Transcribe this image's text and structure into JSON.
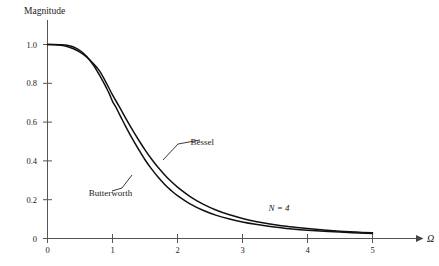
{
  "chart_data": {
    "type": "line",
    "title": "",
    "xlabel": "Ω",
    "ylabel": "Magnitude",
    "xlim": [
      0,
      5.3
    ],
    "ylim": [
      0,
      1.06
    ],
    "xticks": [
      "0",
      "1",
      "2",
      "3",
      "4",
      "5"
    ],
    "xtick_values": [
      0,
      1,
      2,
      3,
      4,
      5
    ],
    "yticks": [
      "0",
      "0.2",
      "0.4",
      "0.6",
      "0.8",
      "1.0"
    ],
    "ytick_values": [
      0,
      0.2,
      0.4,
      0.6,
      0.8,
      1.0
    ],
    "grid": false,
    "legend_position": "inline-annotations",
    "annotations": [
      {
        "text": "Bessel",
        "x": 2.2,
        "y": 0.5
      },
      {
        "text": "Butterworth",
        "x": 0.35,
        "y": 0.235
      },
      {
        "text": "N = 4",
        "x": 3.4,
        "y": 0.155
      }
    ],
    "series": [
      {
        "name": "Butterworth",
        "order": 4,
        "x": [
          0.0,
          0.1,
          0.2,
          0.3,
          0.4,
          0.5,
          0.6,
          0.7,
          0.8,
          0.85,
          0.9,
          0.95,
          1.0,
          1.05,
          1.1,
          1.15,
          1.2,
          1.3,
          1.4,
          1.5,
          1.6,
          1.7,
          1.8,
          1.9,
          2.0,
          2.2,
          2.4,
          2.6,
          2.8,
          3.0,
          3.2,
          3.4,
          3.6,
          3.8,
          4.0,
          4.5,
          5.0
        ],
        "y": [
          1.0,
          1.0,
          0.999,
          0.996,
          0.987,
          0.969,
          0.939,
          0.896,
          0.842,
          0.812,
          0.78,
          0.747,
          0.707,
          0.678,
          0.645,
          0.612,
          0.579,
          0.517,
          0.46,
          0.406,
          0.359,
          0.317,
          0.28,
          0.248,
          0.221,
          0.177,
          0.144,
          0.119,
          0.1,
          0.085,
          0.073,
          0.063,
          0.055,
          0.048,
          0.043,
          0.033,
          0.026
        ]
      },
      {
        "name": "Bessel",
        "order": 4,
        "x": [
          0.0,
          0.1,
          0.2,
          0.3,
          0.4,
          0.5,
          0.6,
          0.7,
          0.8,
          0.9,
          1.0,
          1.1,
          1.2,
          1.3,
          1.4,
          1.5,
          1.6,
          1.7,
          1.8,
          1.9,
          2.0,
          2.2,
          2.4,
          2.6,
          2.8,
          3.0,
          3.2,
          3.4,
          3.6,
          3.8,
          4.0,
          4.25,
          4.5,
          4.75,
          5.0
        ],
        "y": [
          1.0,
          0.999,
          0.996,
          0.99,
          0.978,
          0.961,
          0.936,
          0.903,
          0.864,
          0.805,
          0.74,
          0.682,
          0.622,
          0.564,
          0.509,
          0.457,
          0.41,
          0.367,
          0.329,
          0.295,
          0.265,
          0.215,
          0.176,
          0.146,
          0.122,
          0.103,
          0.088,
          0.076,
          0.066,
          0.058,
          0.051,
          0.044,
          0.038,
          0.033,
          0.029
        ]
      }
    ]
  },
  "labels": {
    "y_axis_title": "Magnitude",
    "x_axis_title": "Ω",
    "bessel": "Bessel",
    "butterworth": "Butterworth",
    "order_note": "N = 4",
    "ytick_0": "0",
    "ytick_02": "0.2",
    "ytick_04": "0.4",
    "ytick_06": "0.6",
    "ytick_08": "0.8",
    "ytick_10": "1.0",
    "xtick_0": "0",
    "xtick_1": "1",
    "xtick_2": "2",
    "xtick_3": "3",
    "xtick_4": "4",
    "xtick_5": "5"
  },
  "colors": {
    "background": "#ffffff",
    "curve": "#111111",
    "axis": "#555555",
    "text": "#1a1a1a"
  }
}
